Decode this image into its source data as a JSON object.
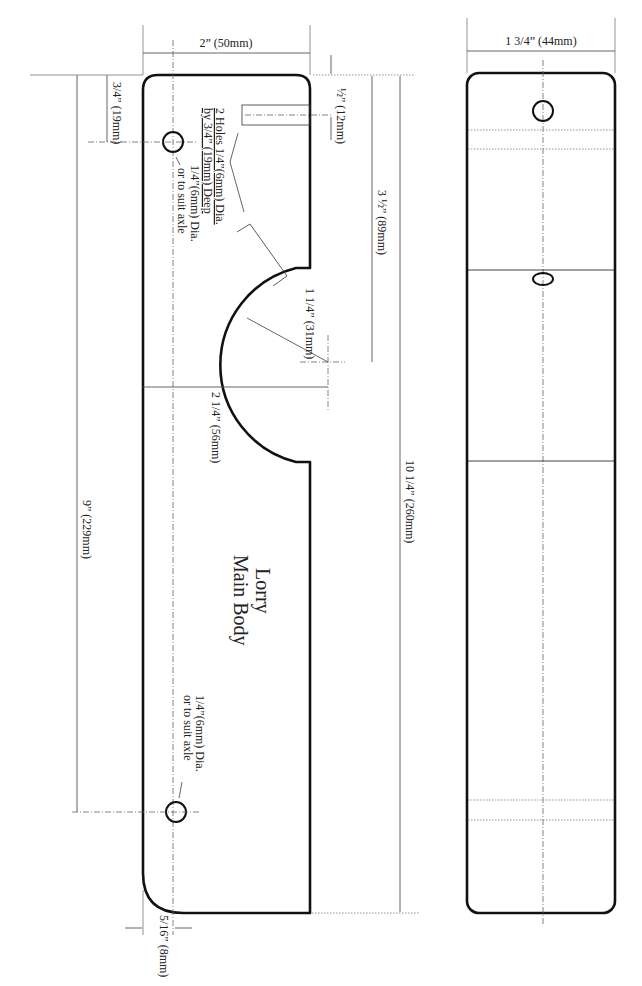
{
  "drawing": {
    "part_title": "Lorry",
    "part_subtitle": "Main Body",
    "side_view": {
      "dimensions": {
        "width": "2” (50mm)",
        "top_to_hole": "3/4” (19mm)",
        "hole_to_hole": "9” (229mm)",
        "slot_offset": "½” (12mm)",
        "notch_depth": "3 ½” (89mm)",
        "overall_length": "10 1/4” (260mm)",
        "notch_radius": "1 1/4” (31mm)",
        "notch_width": "2 1/4” (56mm)",
        "hole_edge_offset": "5/16” (8mm)"
      },
      "notes": {
        "holes_line1": "2 Holes 1/4”(6mm) Dia.",
        "holes_line2": "by 3/4” (19mm) Deep",
        "axle_top_line1": "1/4”(6mm) Dia.",
        "axle_top_line2": "or to suit axle",
        "axle_bottom_line1": "1/4”(6mm) Dia.",
        "axle_bottom_line2": "or to suit axle"
      }
    },
    "top_view": {
      "dimensions": {
        "width": "1 3/4” (44mm)"
      }
    }
  }
}
